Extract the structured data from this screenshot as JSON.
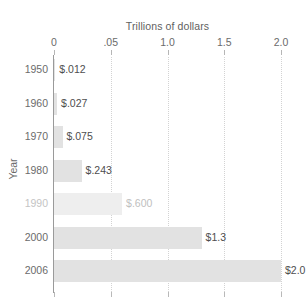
{
  "chart_data": {
    "type": "bar",
    "orientation": "horizontal",
    "title": "",
    "xlabel": "Trillions of dollars",
    "ylabel": "Year",
    "categories": [
      "1950",
      "1960",
      "1970",
      "1980",
      "1990",
      "2000",
      "2006"
    ],
    "values": [
      0.012,
      0.027,
      0.075,
      0.243,
      0.6,
      1.3,
      2.0
    ],
    "value_labels": [
      "$.012",
      "$.027",
      "$.075",
      "$.243",
      "$.600",
      "$1.3",
      "$2.0"
    ],
    "xlim": [
      0,
      2.0
    ],
    "xticks": [
      0,
      0.5,
      1.0,
      1.5,
      2.0
    ],
    "xtick_labels": [
      "0",
      ".05",
      "1.0",
      "1.5",
      "2.0"
    ],
    "grid": true,
    "grid_axis": "x",
    "grid_style": "dotted",
    "legend": "none",
    "bar_color": "#e2e2e2",
    "faded_rows": [
      "1990"
    ]
  },
  "axis": {
    "x_title": "Trillions of dollars",
    "y_title": "Year"
  }
}
